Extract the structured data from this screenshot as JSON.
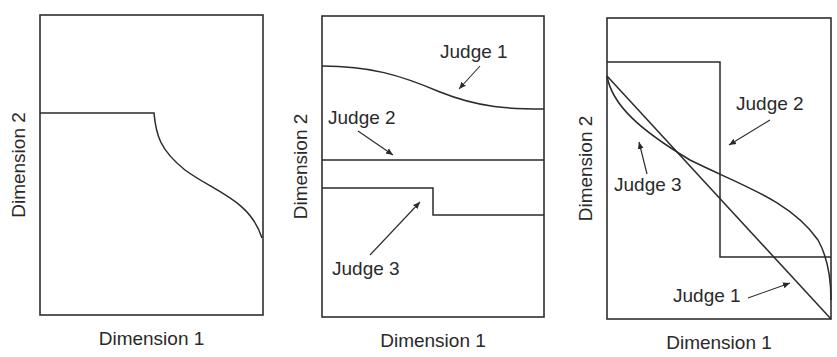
{
  "figure": {
    "panels": [
      {
        "id": "panel-1",
        "xlabel": "Dimension 1",
        "ylabel": "Dimension 2",
        "frame": {
          "x": 40,
          "y": 15,
          "w": 223,
          "h": 300
        },
        "curves": [
          {
            "name": "single-judge-curve",
            "path": "M40,113 L154,113 C156,135 160,150 185,170 C215,192 250,200 262,238"
          }
        ],
        "annotations": []
      },
      {
        "id": "panel-2",
        "xlabel": "Dimension 1",
        "ylabel": "Dimension 2",
        "frame": {
          "x": 322,
          "y": 16,
          "w": 222,
          "h": 301
        },
        "curves": [
          {
            "name": "judge-1-curve",
            "path": "M322,66 C370,66 400,75 440,92 C480,108 510,109 544,109"
          },
          {
            "name": "judge-2-line",
            "path": "M322,160 L544,160"
          },
          {
            "name": "judge-3-step",
            "path": "M322,188 L433,188 L433,215 L544,215"
          }
        ],
        "annotations": [
          {
            "text": "Judge 1",
            "x": 440,
            "y": 58,
            "arrow": "M480,66 L459,89"
          },
          {
            "text": "Judge 2",
            "x": 328,
            "y": 124,
            "arrow": "M358,131 L393,155"
          },
          {
            "text": "Judge 3",
            "x": 332,
            "y": 275,
            "arrow": "M370,255 L420,202"
          }
        ]
      },
      {
        "id": "panel-3",
        "xlabel": "Dimension 1",
        "ylabel": "Dimension 2",
        "frame": {
          "x": 607,
          "y": 18,
          "w": 224,
          "h": 301
        },
        "curves": [
          {
            "name": "judge-1-diagonal",
            "path": "M607,76 L831,319"
          },
          {
            "name": "judge-2-step",
            "path": "M607,62 L720,62 L720,257 L831,257"
          },
          {
            "name": "judge-3-curve",
            "path": "M607,76 C612,105 640,130 690,160 C740,185 790,200 818,240 C828,258 831,280 831,300"
          }
        ],
        "annotations": [
          {
            "text": "Judge 2",
            "x": 736,
            "y": 110,
            "arrow": "M770,120 L729,145"
          },
          {
            "text": "Judge 3",
            "x": 614,
            "y": 191,
            "arrow": "M647,174 L639,142"
          },
          {
            "text": "Judge 1",
            "x": 673,
            "y": 302,
            "arrow": "M748,298 L790,283"
          }
        ]
      }
    ]
  },
  "chart_data": {
    "type": "diagram",
    "title": "",
    "panels": [
      {
        "xlabel": "Dimension 1",
        "ylabel": "Dimension 2",
        "description": "Single boundary: flat at ~67% height for first half, then S-curve decreasing to ~26% height at right edge",
        "series": [
          {
            "name": "boundary",
            "points": [
              [
                0,
                0.67
              ],
              [
                0.51,
                0.67
              ],
              [
                0.6,
                0.48
              ],
              [
                0.85,
                0.38
              ],
              [
                1.0,
                0.26
              ]
            ]
          }
        ]
      },
      {
        "xlabel": "Dimension 1",
        "ylabel": "Dimension 2",
        "series": [
          {
            "name": "Judge 1",
            "points": [
              [
                0,
                0.83
              ],
              [
                0.5,
                0.75
              ],
              [
                1.0,
                0.69
              ]
            ]
          },
          {
            "name": "Judge 2",
            "points": [
              [
                0,
                0.52
              ],
              [
                1.0,
                0.52
              ]
            ]
          },
          {
            "name": "Judge 3",
            "points": [
              [
                0,
                0.43
              ],
              [
                0.5,
                0.43
              ],
              [
                0.5,
                0.34
              ],
              [
                1.0,
                0.34
              ]
            ]
          }
        ]
      },
      {
        "xlabel": "Dimension 1",
        "ylabel": "Dimension 2",
        "series": [
          {
            "name": "Judge 1",
            "points": [
              [
                0,
                0.81
              ],
              [
                1.0,
                0.0
              ]
            ]
          },
          {
            "name": "Judge 2",
            "points": [
              [
                0,
                0.85
              ],
              [
                0.5,
                0.85
              ],
              [
                0.5,
                0.2
              ],
              [
                1.0,
                0.2
              ]
            ]
          },
          {
            "name": "Judge 3",
            "points": [
              [
                0,
                0.81
              ],
              [
                0.37,
                0.53
              ],
              [
                0.8,
                0.4
              ],
              [
                1.0,
                0.06
              ]
            ]
          }
        ]
      }
    ]
  }
}
